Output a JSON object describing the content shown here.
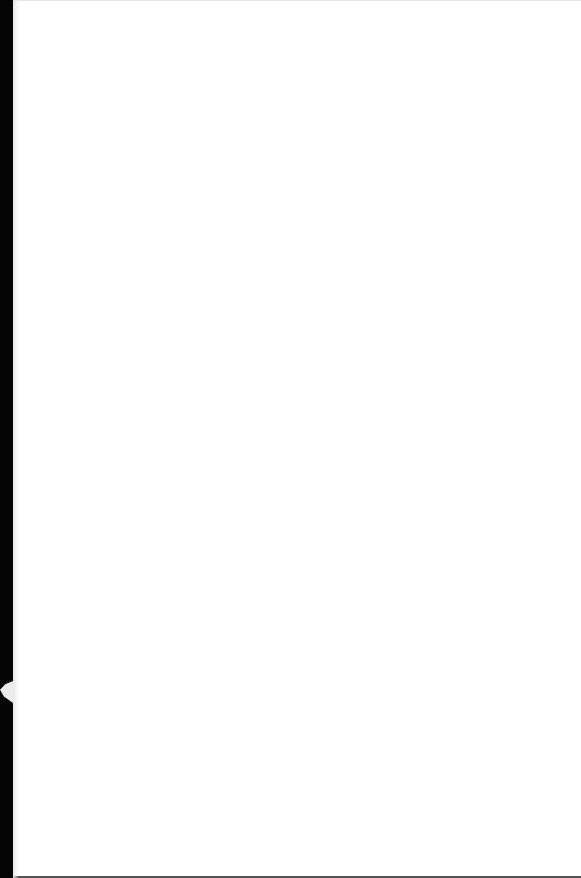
{
  "page": {
    "content": "",
    "background_color": "#ffffff",
    "edge_color": "#050505"
  }
}
